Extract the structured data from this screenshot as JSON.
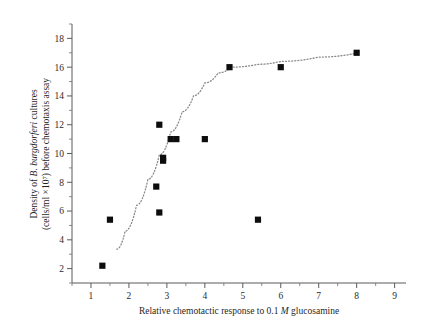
{
  "figure": {
    "name": "chemotaxis-scatter-figure",
    "background": "#ffffff",
    "marker_color": "#0d0d0d",
    "trend_color": "#8a8a8a",
    "axis_color": "#5a5a5a"
  },
  "axes": {
    "x": {
      "label_prefix": "Relative chemotactic response to 0.1 ",
      "label_italic": "M",
      "label_suffix": " glucosamine",
      "label_full": "Relative chemotactic response to 0.1 M glucosamine",
      "ticks": [
        1,
        2,
        3,
        4,
        5,
        6,
        7,
        8,
        9
      ],
      "tick_labels": [
        "1",
        "2",
        "3",
        "4",
        "5",
        "6",
        "7",
        "8",
        "9"
      ],
      "minor_ticks_between": 1,
      "range": [
        0.5,
        9.3
      ]
    },
    "y": {
      "line1_prefix": "Density of ",
      "line1_italic": "B. burgdorferi",
      "line1_suffix": " cultures",
      "line2": "(cells/ml ×10⁷) before chemotaxis assay",
      "label_full": "Density of B. burgdorferi cultures (cells/ml ×107) before chemotaxis assay",
      "ticks": [
        2,
        4,
        6,
        8,
        10,
        12,
        14,
        16,
        18
      ],
      "tick_labels": [
        "2",
        "4",
        "6",
        "8",
        "10",
        "12",
        "14",
        "16",
        "18"
      ],
      "minor_ticks_between": 1,
      "range": [
        1.0,
        19.0
      ]
    }
  },
  "chart_data": {
    "type": "scatter",
    "title": "",
    "xlabel": "Relative chemotactic response to 0.1 M glucosamine",
    "ylabel": "Density of B. burgdorferi cultures (cells/ml ×10^7) before chemotaxis assay",
    "xlim": [
      0.5,
      9.3
    ],
    "ylim": [
      1.0,
      19.0
    ],
    "grid": false,
    "legend": false,
    "marker": "filled-square",
    "points": [
      {
        "x": 1.3,
        "y": 2.2
      },
      {
        "x": 1.5,
        "y": 5.4
      },
      {
        "x": 2.72,
        "y": 7.7
      },
      {
        "x": 2.8,
        "y": 5.9
      },
      {
        "x": 2.8,
        "y": 12.0
      },
      {
        "x": 2.9,
        "y": 9.5
      },
      {
        "x": 2.9,
        "y": 9.7
      },
      {
        "x": 3.1,
        "y": 11.0
      },
      {
        "x": 3.25,
        "y": 11.0
      },
      {
        "x": 4.0,
        "y": 11.0
      },
      {
        "x": 4.65,
        "y": 16.0
      },
      {
        "x": 5.4,
        "y": 5.4
      },
      {
        "x": 6.0,
        "y": 16.0
      },
      {
        "x": 8.0,
        "y": 17.0
      }
    ],
    "trend_line": {
      "style": "dotted",
      "description": "sigmoidal fitted curve",
      "points": [
        {
          "x": 1.68,
          "y": 3.35
        },
        {
          "x": 1.9,
          "y": 4.6
        },
        {
          "x": 2.2,
          "y": 6.4
        },
        {
          "x": 2.5,
          "y": 8.2
        },
        {
          "x": 2.8,
          "y": 9.9
        },
        {
          "x": 3.1,
          "y": 11.5
        },
        {
          "x": 3.4,
          "y": 12.9
        },
        {
          "x": 3.7,
          "y": 14.0
        },
        {
          "x": 4.0,
          "y": 14.9
        },
        {
          "x": 4.35,
          "y": 15.6
        },
        {
          "x": 4.7,
          "y": 16.0
        },
        {
          "x": 5.4,
          "y": 16.2
        },
        {
          "x": 6.0,
          "y": 16.4
        },
        {
          "x": 7.0,
          "y": 16.7
        },
        {
          "x": 8.05,
          "y": 17.0
        }
      ]
    }
  }
}
